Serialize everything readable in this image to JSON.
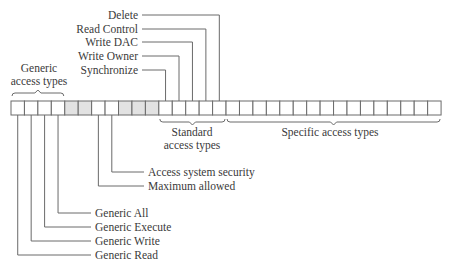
{
  "diagram": {
    "bit_count": 32,
    "colors": {
      "cell_white": "#ffffff",
      "cell_gray": "#e2e2e2",
      "line": "#6a6a6a",
      "text": "#3a3a3a"
    },
    "shaded_cells": [
      4,
      5,
      8,
      9,
      10
    ],
    "groups": [
      {
        "label_line1": "Generic",
        "label_line2": "access types",
        "from": 0,
        "to": 3,
        "position": "above"
      },
      {
        "label_line1": "Standard",
        "label_line2": "access types",
        "from": 11,
        "to": 15,
        "position": "below"
      },
      {
        "label_line1": "Specific access types",
        "label_line2": "",
        "from": 16,
        "to": 31,
        "position": "below"
      }
    ],
    "top_labels": [
      {
        "text": "Delete",
        "bit": 15
      },
      {
        "text": "Read Control",
        "bit": 14
      },
      {
        "text": "Write DAC",
        "bit": 13
      },
      {
        "text": "Write Owner",
        "bit": 12
      },
      {
        "text": "Synchronize",
        "bit": 11
      }
    ],
    "bottom_labels": [
      {
        "text": "Access system security",
        "bit": 7
      },
      {
        "text": "Maximum allowed",
        "bit": 6
      },
      {
        "text": "Generic All",
        "bit": 3
      },
      {
        "text": "Generic Execute",
        "bit": 2
      },
      {
        "text": "Generic Write",
        "bit": 1
      },
      {
        "text": "Generic Read",
        "bit": 0
      }
    ]
  }
}
